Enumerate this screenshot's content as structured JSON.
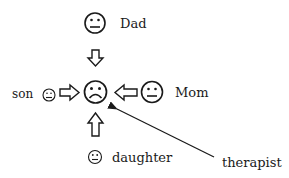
{
  "diagram": {
    "type": "family-systems",
    "center": {
      "label": "",
      "expression": "sad",
      "icon": "sad-face-icon"
    },
    "members": [
      {
        "id": "dad",
        "label": "Dad",
        "expression": "neutral",
        "icon": "neutral-face-icon",
        "arrow": "down"
      },
      {
        "id": "mom",
        "label": "Mom",
        "expression": "neutral",
        "icon": "neutral-face-icon",
        "arrow": "left"
      },
      {
        "id": "son",
        "label": "son",
        "expression": "neutral",
        "icon": "neutral-face-icon",
        "arrow": "right"
      },
      {
        "id": "daughter",
        "label": "daughter",
        "expression": "neutral",
        "icon": "neutral-face-icon",
        "arrow": "up"
      }
    ],
    "pointer": {
      "label": "therapist",
      "target": "center",
      "arrow": "thin-line-arrow"
    },
    "colors": {
      "stroke": "#1a1a1a",
      "background": "#ffffff"
    }
  }
}
